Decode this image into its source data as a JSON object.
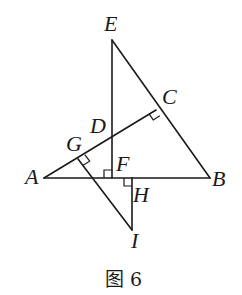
{
  "figure": {
    "caption": "图 6",
    "points": {
      "E": {
        "label": "E",
        "x": 112,
        "y": 40
      },
      "A": {
        "label": "A",
        "x": 44,
        "y": 178
      },
      "B": {
        "label": "B",
        "x": 210,
        "y": 178
      },
      "C": {
        "label": "C",
        "x": 156,
        "y": 110
      },
      "D": {
        "label": "D",
        "x": 112,
        "y": 133
      },
      "F": {
        "label": "F",
        "x": 112,
        "y": 178
      },
      "G": {
        "label": "G",
        "x": 78,
        "y": 159
      },
      "H": {
        "label": "H",
        "x": 132,
        "y": 178
      },
      "I": {
        "label": "I",
        "x": 132,
        "y": 230
      }
    },
    "segments": [
      "EF",
      "EB",
      "AB",
      "AC",
      "GI",
      "HI"
    ],
    "right_angles": [
      "C",
      "F",
      "G",
      "H"
    ],
    "colors": {
      "stroke": "#1a1a1a",
      "background": "#ffffff"
    }
  }
}
